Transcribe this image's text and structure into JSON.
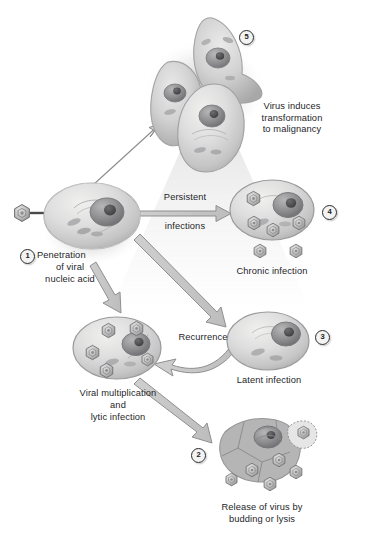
{
  "figure": {
    "background": "#ffffff",
    "text_color": "#252528",
    "cell_fill": "#dcdcdc",
    "nucleus_fill": "#9a9a9c",
    "virion_fill": "#b9b9ba"
  },
  "steps": [
    {
      "id": "1",
      "badge": "1",
      "label_lines": [
        "Penetration",
        "of viral",
        "nucleic acid"
      ],
      "label": "Penetration of viral nucleic acid"
    },
    {
      "id": "2",
      "badge": "2",
      "label_lines": [
        "Release of virus by",
        "budding or lysis"
      ],
      "label": "Release of virus by budding or lysis"
    },
    {
      "id": "3",
      "badge": "3",
      "label_lines": [
        "Latent infection"
      ],
      "label": "Latent infection"
    },
    {
      "id": "4",
      "badge": "4",
      "label_lines": [
        "Chronic infection"
      ],
      "label": "Chronic infection"
    },
    {
      "id": "5",
      "badge": "5",
      "label_lines": [
        "Virus induces",
        "transformation",
        "to malignancy"
      ],
      "label": "Virus induces transformation to malignancy"
    }
  ],
  "labels": {
    "penetration_l1": "Penetration",
    "penetration_l2": "of viral",
    "penetration_l3": "nucleic acid",
    "persistent_l1": "Persistent",
    "persistent_l2": "infections",
    "transformation_l1": "Virus induces",
    "transformation_l2": "transformation",
    "transformation_l3": "to malignancy",
    "chronic": "Chronic infection",
    "latent": "Latent infection",
    "recurrence": "Recurrence",
    "multiplication_l1": "Viral multiplication",
    "multiplication_l2": "and",
    "multiplication_l3": "lytic infection",
    "release_l1": "Release of virus by",
    "release_l2": "budding or lysis"
  },
  "badges": {
    "one": "1",
    "two": "2",
    "three": "3",
    "four": "4",
    "five": "5"
  },
  "cells": [
    {
      "name": "infected-host-cell",
      "virions_inside": 0,
      "virions_outside": 1
    },
    {
      "name": "transformed-malignant-cells",
      "count": 3
    },
    {
      "name": "chronic-infection-cell",
      "virions_inside": 4,
      "virions_outside": 2
    },
    {
      "name": "latent-infection-cell",
      "virions_inside": 0
    },
    {
      "name": "viral-multiplication-cell",
      "virions_inside": 5
    },
    {
      "name": "lysed-cell-releasing-virus",
      "virions_released": 5,
      "budding_virion": 1
    }
  ]
}
